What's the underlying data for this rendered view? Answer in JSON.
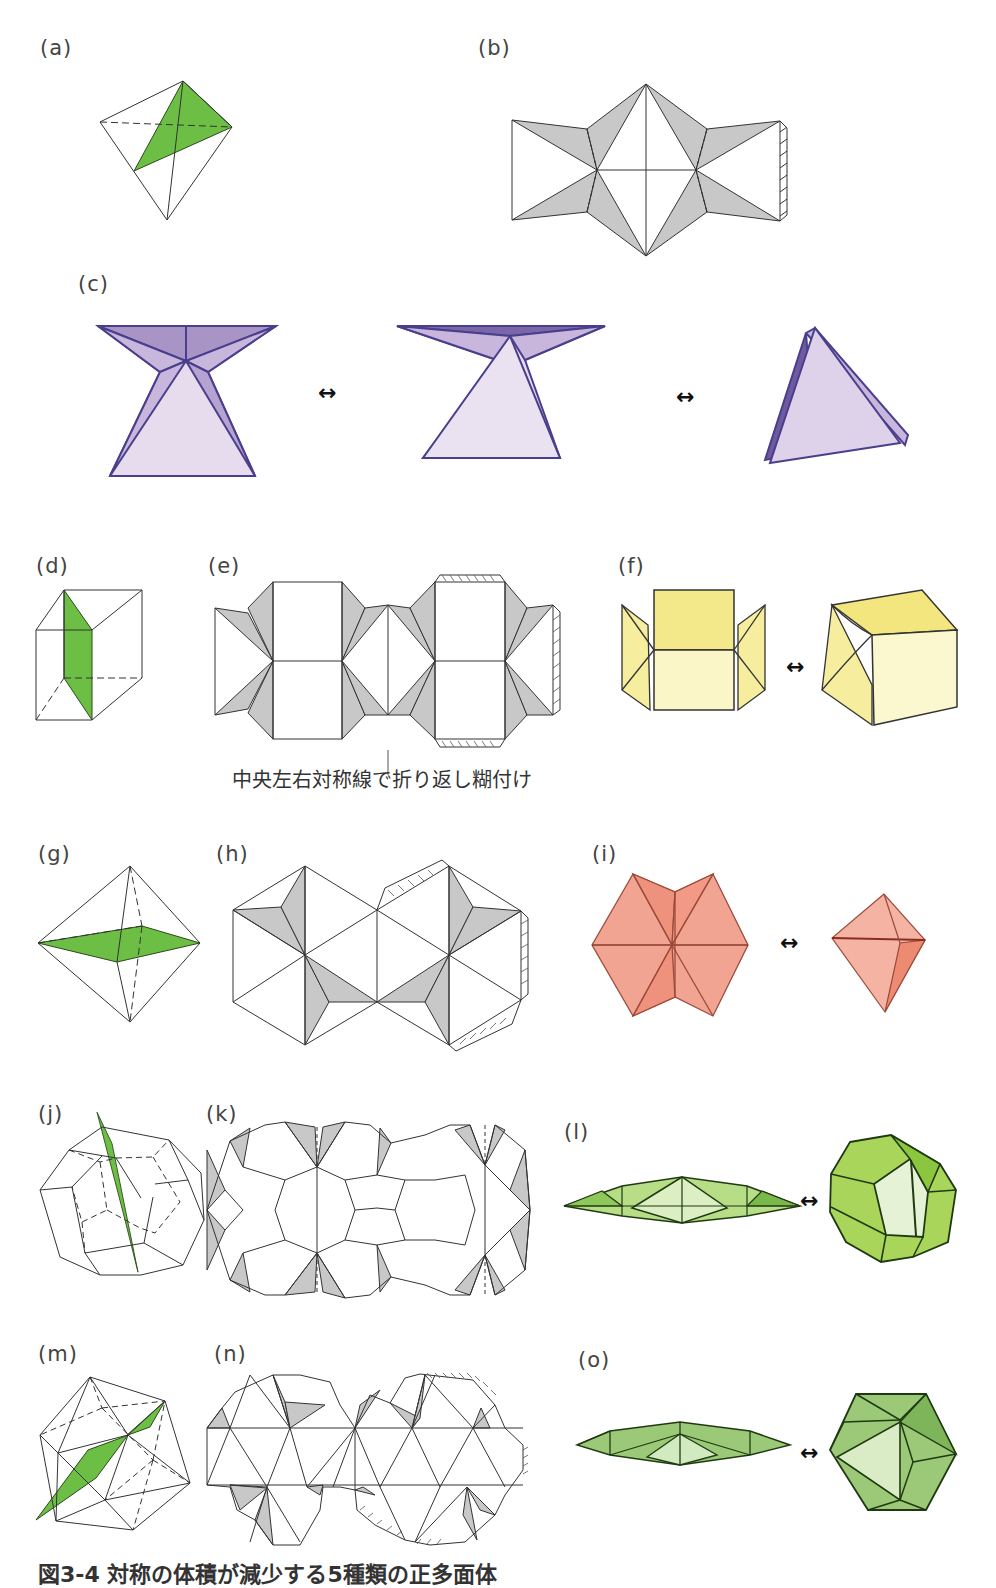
{
  "labels": {
    "a": "(a)",
    "b": "(b)",
    "c": "(c)",
    "d": "(d)",
    "e": "(e)",
    "f": "(f)",
    "g": "(g)",
    "h": "(h)",
    "i": "(i)",
    "j": "(j)",
    "k": "(k)",
    "l": "(l)",
    "m": "(m)",
    "n": "(n)",
    "o": "(o)"
  },
  "annotation_e": "中央左右対称線で折り返し糊付け",
  "caption": "図3-4 対称の体積が減少する5種類の正多面体",
  "arrow_symbol": "↔",
  "colors": {
    "section_green": "#6dbe45",
    "tab_gray": "#c8c8c8",
    "tetra_purple": "#c9b6dc",
    "tetra_dark": "#8d78b4",
    "cube_yellow": "#f6ee9e",
    "octa_pink": "#f2a493",
    "dodeca_green": "#a9d65a",
    "icosa_green": "#9bc977"
  }
}
